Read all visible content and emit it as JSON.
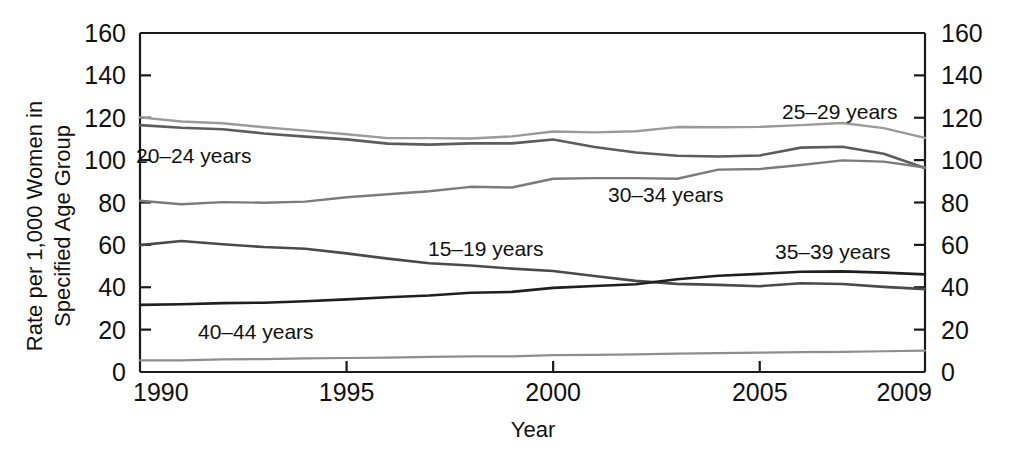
{
  "chart_data": {
    "type": "line",
    "title": "",
    "xlabel": "Year",
    "ylabel": "Rate per 1,000 Women in Specified Age Group",
    "ylabel_line1": "Rate per 1,000 Women in",
    "ylabel_line2": "Specified Age Group",
    "xlim": [
      1990,
      2009
    ],
    "ylim": [
      0,
      160
    ],
    "grid": false,
    "legend_position": "inline-labels",
    "dual_y_axis": true,
    "x_ticks": [
      1990,
      1995,
      2000,
      2005,
      2009
    ],
    "x_tick_labels": [
      "1990",
      "1995",
      "2000",
      "2005",
      "2009"
    ],
    "y_ticks": [
      0,
      20,
      40,
      60,
      80,
      100,
      120,
      140,
      160
    ],
    "y_tick_labels": [
      "0",
      "20",
      "40",
      "60",
      "80",
      "100",
      "120",
      "140",
      "160"
    ],
    "y_ticks_right": [
      0,
      20,
      40,
      60,
      80,
      100,
      120,
      140,
      160
    ],
    "y_tick_labels_right": [
      "0",
      "20",
      "40",
      "60",
      "80",
      "100",
      "120",
      "140",
      "160"
    ],
    "x": [
      1990,
      1991,
      1992,
      1993,
      1994,
      1995,
      1996,
      1997,
      1998,
      1999,
      2000,
      2001,
      2002,
      2003,
      2004,
      2005,
      2006,
      2007,
      2008,
      2009
    ],
    "series": [
      {
        "name": "25–29 years",
        "label": "25–29 years",
        "color": "#9a9a9a",
        "stroke_width": 2.4,
        "values": [
          120.2,
          118.2,
          117.4,
          115.5,
          113.9,
          112.2,
          110.4,
          110.4,
          110.2,
          111.2,
          113.5,
          113.1,
          113.6,
          115.6,
          115.5,
          115.7,
          116.5,
          117.5,
          115.1,
          110.5
        ]
      },
      {
        "name": "20–24 years",
        "label": "20–24 years",
        "color": "#5c5c5c",
        "stroke_width": 2.6,
        "values": [
          116.5,
          115.3,
          114.6,
          112.6,
          111.1,
          109.8,
          107.8,
          107.3,
          107.9,
          107.9,
          109.7,
          106.2,
          103.6,
          102.1,
          101.7,
          102.2,
          105.9,
          106.3,
          103.0,
          96.3
        ]
      },
      {
        "name": "30–34 years",
        "label": "30–34 years",
        "color": "#7b7b7b",
        "stroke_width": 2.4,
        "values": [
          80.8,
          79.2,
          80.2,
          79.9,
          80.4,
          82.5,
          83.9,
          85.3,
          87.4,
          87.1,
          91.2,
          91.5,
          91.5,
          91.2,
          95.5,
          95.8,
          97.7,
          99.9,
          99.3,
          96.5
        ]
      },
      {
        "name": "15–19 years",
        "label": "15–19 years",
        "color": "#4a4a4a",
        "stroke_width": 2.6,
        "values": [
          59.9,
          61.8,
          60.3,
          59.0,
          58.2,
          56.0,
          53.5,
          51.3,
          50.3,
          48.8,
          47.7,
          45.3,
          43.0,
          41.6,
          41.1,
          40.5,
          41.9,
          41.5,
          40.2,
          39.1
        ]
      },
      {
        "name": "35–39 years",
        "label": "35–39 years",
        "color": "#1f1f1f",
        "stroke_width": 2.6,
        "values": [
          31.7,
          32.0,
          32.5,
          32.7,
          33.4,
          34.3,
          35.3,
          36.1,
          37.4,
          37.8,
          39.7,
          40.6,
          41.4,
          43.8,
          45.4,
          46.3,
          47.3,
          47.5,
          46.9,
          46.1
        ]
      },
      {
        "name": "40–44 years",
        "label": "40–44 years",
        "color": "#8e8e8e",
        "stroke_width": 2.2,
        "values": [
          5.5,
          5.5,
          6.0,
          6.1,
          6.4,
          6.6,
          6.8,
          7.1,
          7.4,
          7.4,
          8.0,
          8.1,
          8.3,
          8.7,
          8.9,
          9.1,
          9.4,
          9.5,
          9.8,
          10.1
        ]
      }
    ],
    "annotations": [
      {
        "text": "25–29 years",
        "x_px": 782,
        "y_px": 119,
        "series": "25–29 years"
      },
      {
        "text": "20–24 years",
        "x_px": 136,
        "y_px": 163,
        "series": "20–24 years"
      },
      {
        "text": "30–34 years",
        "x_px": 608,
        "y_px": 202,
        "series": "30–34 years"
      },
      {
        "text": "15–19 years",
        "x_px": 428,
        "y_px": 256,
        "series": "15–19 years"
      },
      {
        "text": "35–39 years",
        "x_px": 775,
        "y_px": 259,
        "series": "35–39 years"
      },
      {
        "text": "40–44 years",
        "x_px": 198,
        "y_px": 339,
        "series": "40–44 years"
      }
    ]
  },
  "plot_geometry": {
    "left": 140,
    "right": 925,
    "top": 33,
    "bottom": 372
  }
}
